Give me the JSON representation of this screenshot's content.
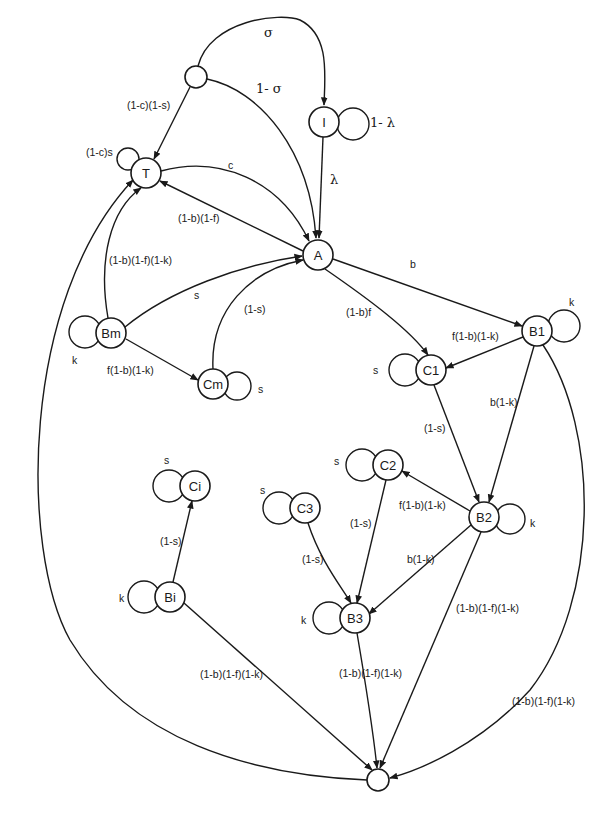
{
  "diagram": {
    "type": "state-transition",
    "colors": {
      "stroke": "#1a1a1a",
      "background": "#ffffff"
    },
    "nodes": {
      "top_junction": {
        "label": "",
        "x": 196,
        "y": 77,
        "r": 11
      },
      "I": {
        "label": "I",
        "x": 324,
        "y": 122,
        "r": 15
      },
      "T": {
        "label": "T",
        "x": 146,
        "y": 173,
        "r": 15
      },
      "A": {
        "label": "A",
        "x": 318,
        "y": 255,
        "r": 15
      },
      "Bm": {
        "label": "Bm",
        "x": 111,
        "y": 333,
        "r": 15
      },
      "Cm": {
        "label": "Cm",
        "x": 213,
        "y": 384,
        "r": 15
      },
      "B1": {
        "label": "B1",
        "x": 537,
        "y": 331,
        "r": 15
      },
      "C1": {
        "label": "C1",
        "x": 431,
        "y": 370,
        "r": 15
      },
      "C2": {
        "label": "C2",
        "x": 388,
        "y": 465,
        "r": 15
      },
      "C3": {
        "label": "C3",
        "x": 305,
        "y": 508,
        "r": 15
      },
      "B2": {
        "label": "B2",
        "x": 484,
        "y": 517,
        "r": 15
      },
      "Ci": {
        "label": "Ci",
        "x": 195,
        "y": 486,
        "r": 15
      },
      "Bi": {
        "label": "Bi",
        "x": 170,
        "y": 597,
        "r": 15
      },
      "B3": {
        "label": "B3",
        "x": 355,
        "y": 618,
        "r": 15
      },
      "bottom_junction": {
        "label": "",
        "x": 378,
        "y": 780,
        "r": 11
      }
    },
    "labels": {
      "sigma": "σ",
      "one_minus_sigma": "1- σ",
      "one_minus_lambda": "1- λ",
      "lambda": "λ",
      "junction_to_T": "(1-c)(1-s)",
      "T_self": "(1-c)s",
      "T_to_A": "c",
      "A_to_T": "(1-b)(1-f)",
      "Bm_to_T": "(1-b)(1-f)(1-k)",
      "Bm_to_A": "s",
      "Cm_to_A": "(1-s)",
      "Bm_self": "k",
      "Bm_to_Cm": "f(1-b)(1-k)",
      "Cm_self": "s",
      "A_to_B1": "b",
      "A_to_C1": "(1-b)f",
      "B1_self": "k",
      "B1_to_C1": "f(1-b)(1-k)",
      "C1_self": "s",
      "C1_to_B2": "(1-s)",
      "B1_to_B2": "b(1-k)",
      "C2_self": "s",
      "B2_to_C2": "f(1-b)(1-k)",
      "B2_self": "k",
      "C3_self": "s",
      "C2_to_B3": "(1-s)",
      "C3_to_B3": "(1-s)",
      "B2_to_B3": "b(1-k)",
      "Ci_self": "s",
      "Bi_to_Ci": "(1-s)",
      "Bi_self": "k",
      "B3_self": "k",
      "B2_to_bottom": "(1-b)(1-f)(1-k)",
      "Bi_to_bottom": "(1-b)(1-f)(1-k)",
      "B3_to_bottom": "(1-b)(1-f)(1-k)",
      "B1_to_bottom": "(1-b)(1-f)(1-k)"
    }
  }
}
